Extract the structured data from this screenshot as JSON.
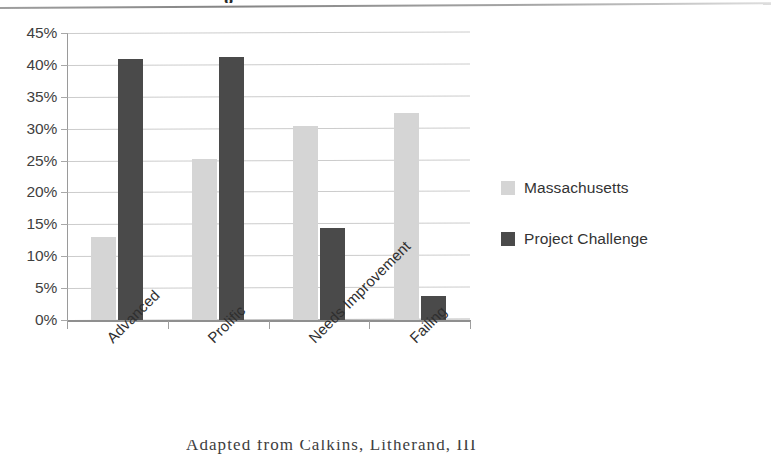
{
  "page": {
    "title_fragment": "g",
    "footer_fragment": "Adapted from Calkins, Litherand, III"
  },
  "chart_data": {
    "type": "bar",
    "title": "",
    "xlabel": "",
    "ylabel": "",
    "categories": [
      "Advanced",
      "Prolific",
      "Needs Improvement",
      "Failing"
    ],
    "series": [
      {
        "name": "Massachusetts",
        "color": "#d5d5d5",
        "values": [
          13.0,
          25.2,
          30.4,
          32.5
        ]
      },
      {
        "name": "Project Challenge",
        "color": "#4a4a4a",
        "values": [
          41.0,
          41.2,
          14.5,
          3.7
        ]
      }
    ],
    "ylim": [
      0,
      45
    ],
    "ytick_values": [
      0,
      5,
      10,
      15,
      20,
      25,
      30,
      35,
      40,
      45
    ],
    "ytick_labels": [
      "0%",
      "5%",
      "10%",
      "15%",
      "20%",
      "25%",
      "30%",
      "35%",
      "40%",
      "45%"
    ],
    "grid": true,
    "grid_axis": "y",
    "legend_position": "right",
    "value_format": "percent"
  }
}
